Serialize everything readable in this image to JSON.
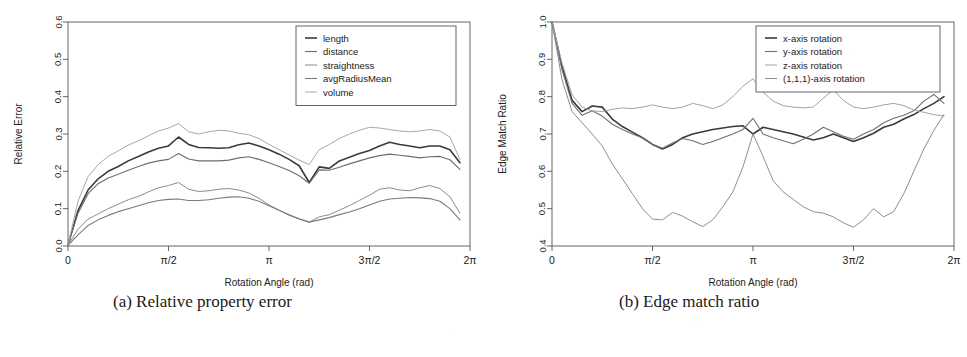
{
  "figure": {
    "panels": [
      {
        "caption": "(a) Relative property error",
        "chart_key": "chart_a"
      },
      {
        "caption": "(b) Edge match ratio",
        "chart_key": "chart_b"
      }
    ]
  },
  "chart_data": [
    {
      "type": "line",
      "title": "",
      "panel_label": "(a) Relative property error",
      "xlabel": "Rotation Angle (rad)",
      "ylabel": "Relative Error",
      "xlim": [
        0,
        6.283185
      ],
      "ylim": [
        0.0,
        0.6
      ],
      "grid": false,
      "legend_position": "top-right",
      "xticks": [
        0,
        1.570796,
        3.141593,
        4.712389,
        6.283185
      ],
      "xticklabels": [
        "0",
        "π/2",
        "π",
        "3π/2",
        "2π"
      ],
      "yticks": [
        0.0,
        0.1,
        0.2,
        0.3,
        0.4,
        0.5,
        0.6
      ],
      "yticklabels": [
        "0.0",
        "0.1",
        "0.2",
        "0.3",
        "0.4",
        "0.5",
        "0.6"
      ],
      "x": [
        0.0,
        0.157,
        0.314,
        0.471,
        0.628,
        0.785,
        0.942,
        1.1,
        1.257,
        1.414,
        1.571,
        1.728,
        1.885,
        2.042,
        2.199,
        2.356,
        2.513,
        2.67,
        2.827,
        2.985,
        3.142,
        3.299,
        3.456,
        3.613,
        3.77,
        3.927,
        4.084,
        4.241,
        4.398,
        4.555,
        4.712,
        4.869,
        5.027,
        5.184,
        5.341,
        5.498,
        5.655,
        5.812,
        5.969,
        6.126
      ],
      "series": [
        {
          "name": "length",
          "color": "#3a3a3a",
          "width": 1.6,
          "values": [
            0.003,
            0.095,
            0.15,
            0.18,
            0.2,
            0.213,
            0.228,
            0.24,
            0.252,
            0.262,
            0.268,
            0.292,
            0.272,
            0.264,
            0.263,
            0.262,
            0.263,
            0.271,
            0.276,
            0.268,
            0.258,
            0.246,
            0.232,
            0.215,
            0.17,
            0.212,
            0.208,
            0.228,
            0.238,
            0.248,
            0.256,
            0.268,
            0.278,
            0.272,
            0.268,
            0.263,
            0.268,
            0.268,
            0.258,
            0.223
          ]
        },
        {
          "name": "distance",
          "color": "#6e6e6e",
          "width": 1.1,
          "values": [
            0.003,
            0.088,
            0.14,
            0.167,
            0.182,
            0.192,
            0.203,
            0.213,
            0.222,
            0.228,
            0.232,
            0.248,
            0.233,
            0.228,
            0.228,
            0.228,
            0.23,
            0.236,
            0.239,
            0.232,
            0.223,
            0.213,
            0.202,
            0.188,
            0.168,
            0.204,
            0.203,
            0.211,
            0.22,
            0.228,
            0.236,
            0.242,
            0.246,
            0.243,
            0.24,
            0.236,
            0.239,
            0.24,
            0.231,
            0.205
          ]
        },
        {
          "name": "straightness",
          "color": "#8c8c8c",
          "width": 1.0,
          "values": [
            0.002,
            0.045,
            0.072,
            0.086,
            0.1,
            0.112,
            0.124,
            0.133,
            0.145,
            0.156,
            0.162,
            0.17,
            0.152,
            0.146,
            0.148,
            0.152,
            0.154,
            0.15,
            0.142,
            0.128,
            0.11,
            0.096,
            0.082,
            0.072,
            0.064,
            0.078,
            0.084,
            0.096,
            0.108,
            0.122,
            0.136,
            0.152,
            0.156,
            0.15,
            0.148,
            0.156,
            0.162,
            0.154,
            0.132,
            0.088
          ]
        },
        {
          "name": "avgRadiusMean",
          "color": "#7a7a7a",
          "width": 1.1,
          "values": [
            0.002,
            0.03,
            0.055,
            0.07,
            0.082,
            0.092,
            0.1,
            0.108,
            0.116,
            0.122,
            0.125,
            0.126,
            0.122,
            0.122,
            0.124,
            0.128,
            0.131,
            0.132,
            0.128,
            0.12,
            0.108,
            0.096,
            0.084,
            0.073,
            0.064,
            0.07,
            0.076,
            0.084,
            0.091,
            0.1,
            0.11,
            0.12,
            0.126,
            0.128,
            0.13,
            0.129,
            0.127,
            0.12,
            0.1,
            0.07
          ]
        },
        {
          "name": "volume",
          "color": "#a8a8a8",
          "width": 1.0,
          "values": [
            0.004,
            0.12,
            0.186,
            0.218,
            0.24,
            0.255,
            0.27,
            0.282,
            0.295,
            0.308,
            0.316,
            0.328,
            0.306,
            0.3,
            0.306,
            0.31,
            0.308,
            0.302,
            0.298,
            0.288,
            0.272,
            0.258,
            0.244,
            0.23,
            0.218,
            0.258,
            0.272,
            0.288,
            0.3,
            0.31,
            0.318,
            0.316,
            0.312,
            0.308,
            0.306,
            0.308,
            0.312,
            0.308,
            0.292,
            0.232
          ]
        }
      ]
    },
    {
      "type": "line",
      "title": "",
      "panel_label": "(b) Edge match ratio",
      "xlabel": "Rotation Angle (rad)",
      "ylabel": "Edge Match Ratio",
      "xlim": [
        0,
        6.283185
      ],
      "ylim": [
        0.4,
        1.0
      ],
      "grid": false,
      "legend_position": "top-right",
      "xticks": [
        0,
        1.570796,
        3.141593,
        4.712389,
        6.283185
      ],
      "xticklabels": [
        "0",
        "π/2",
        "π",
        "3π/2",
        "2π"
      ],
      "yticks": [
        0.4,
        0.5,
        0.6,
        0.7,
        0.8,
        0.9,
        1.0
      ],
      "yticklabels": [
        "0.4",
        "0.5",
        "0.6",
        "0.7",
        "0.8",
        "0.9",
        "1.0"
      ],
      "x": [
        0.0,
        0.157,
        0.314,
        0.471,
        0.628,
        0.785,
        0.942,
        1.1,
        1.257,
        1.414,
        1.571,
        1.728,
        1.885,
        2.042,
        2.199,
        2.356,
        2.513,
        2.67,
        2.827,
        2.985,
        3.142,
        3.299,
        3.456,
        3.613,
        3.77,
        3.927,
        4.084,
        4.241,
        4.398,
        4.555,
        4.712,
        4.869,
        5.027,
        5.184,
        5.341,
        5.498,
        5.655,
        5.812,
        5.969,
        6.126
      ],
      "series": [
        {
          "name": "x-axis rotation",
          "color": "#3a3a3a",
          "width": 1.6,
          "values": [
            1.0,
            0.88,
            0.79,
            0.76,
            0.775,
            0.772,
            0.74,
            0.72,
            0.705,
            0.69,
            0.672,
            0.66,
            0.672,
            0.69,
            0.7,
            0.706,
            0.712,
            0.716,
            0.72,
            0.722,
            0.7,
            0.718,
            0.712,
            0.706,
            0.7,
            0.692,
            0.684,
            0.69,
            0.7,
            0.69,
            0.68,
            0.69,
            0.702,
            0.718,
            0.726,
            0.74,
            0.752,
            0.768,
            0.782,
            0.8
          ]
        },
        {
          "name": "y-axis rotation",
          "color": "#707070",
          "width": 1.1,
          "values": [
            1.0,
            0.872,
            0.782,
            0.75,
            0.762,
            0.748,
            0.726,
            0.712,
            0.7,
            0.69,
            0.672,
            0.662,
            0.676,
            0.688,
            0.682,
            0.672,
            0.68,
            0.69,
            0.7,
            0.712,
            0.742,
            0.7,
            0.69,
            0.682,
            0.674,
            0.686,
            0.7,
            0.718,
            0.706,
            0.694,
            0.686,
            0.7,
            0.712,
            0.73,
            0.742,
            0.75,
            0.762,
            0.788,
            0.806,
            0.782
          ]
        },
        {
          "name": "z-axis rotation",
          "color": "#a2a2a2",
          "width": 1.0,
          "values": [
            1.0,
            0.89,
            0.805,
            0.772,
            0.762,
            0.76,
            0.766,
            0.77,
            0.768,
            0.772,
            0.778,
            0.772,
            0.768,
            0.772,
            0.782,
            0.776,
            0.768,
            0.778,
            0.8,
            0.828,
            0.848,
            0.812,
            0.788,
            0.776,
            0.772,
            0.77,
            0.772,
            0.796,
            0.818,
            0.79,
            0.772,
            0.768,
            0.772,
            0.778,
            0.782,
            0.776,
            0.764,
            0.758,
            0.752,
            0.748
          ]
        },
        {
          "name": "(1,1,1)-axis rotation",
          "color": "#8e8e8e",
          "width": 1.0,
          "values": [
            1.0,
            0.845,
            0.76,
            0.73,
            0.7,
            0.668,
            0.62,
            0.58,
            0.54,
            0.5,
            0.472,
            0.47,
            0.49,
            0.48,
            0.465,
            0.452,
            0.47,
            0.505,
            0.545,
            0.612,
            0.7,
            0.64,
            0.575,
            0.545,
            0.525,
            0.505,
            0.492,
            0.488,
            0.478,
            0.462,
            0.45,
            0.47,
            0.5,
            0.478,
            0.492,
            0.54,
            0.6,
            0.66,
            0.71,
            0.752
          ]
        }
      ]
    }
  ]
}
